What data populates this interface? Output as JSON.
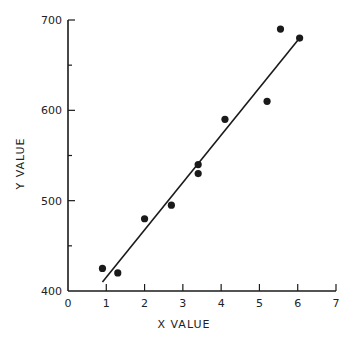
{
  "chart_data": {
    "type": "scatter",
    "title": "",
    "xlabel": "X VALUE",
    "ylabel": "Y VALUE",
    "xlim": [
      0,
      7
    ],
    "ylim": [
      400,
      700
    ],
    "xticks": [
      0,
      1,
      2,
      3,
      4,
      5,
      6,
      7
    ],
    "yticks": [
      400,
      500,
      600,
      700
    ],
    "y_minor_ticks": [
      450,
      550,
      650
    ],
    "grid": false,
    "legend": null,
    "series": [
      {
        "name": "data",
        "type": "scatter",
        "points": [
          {
            "x": 0.9,
            "y": 425
          },
          {
            "x": 1.3,
            "y": 420
          },
          {
            "x": 2.0,
            "y": 480
          },
          {
            "x": 2.7,
            "y": 495
          },
          {
            "x": 3.4,
            "y": 540
          },
          {
            "x": 3.4,
            "y": 530
          },
          {
            "x": 4.1,
            "y": 590
          },
          {
            "x": 5.2,
            "y": 610
          },
          {
            "x": 5.55,
            "y": 690
          },
          {
            "x": 6.05,
            "y": 680
          }
        ]
      },
      {
        "name": "fit",
        "type": "line",
        "points": [
          {
            "x": 0.9,
            "y": 410
          },
          {
            "x": 6.05,
            "y": 680
          }
        ]
      }
    ]
  },
  "colors": {
    "ink": "#1a1a1a",
    "background": "#ffffff"
  }
}
